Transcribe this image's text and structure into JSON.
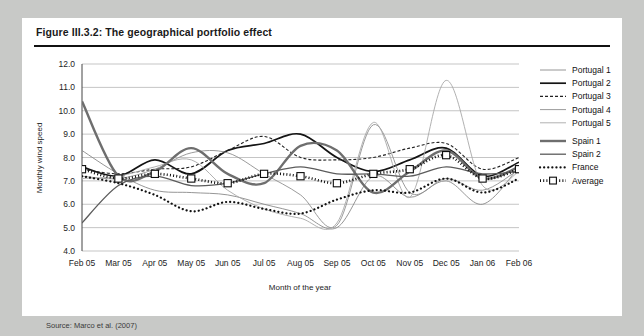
{
  "figure": {
    "title": "Figure III.3.2: The geographical portfolio effect",
    "source": "Source: Marco et al. (2007)"
  },
  "chart_data": {
    "type": "line",
    "title": "",
    "xlabel": "Month of the year",
    "ylabel": "Monthly wind speed",
    "ylim": [
      4.0,
      12.0
    ],
    "ytick_step": 1.0,
    "ytick_labels": [
      "12.0",
      "11.0",
      "10.0",
      "9.0",
      "8.0",
      "7.0",
      "6.0",
      "5.0",
      "4.0"
    ],
    "grid": "horizontal",
    "legend_position": "right",
    "categories": [
      "Feb 05",
      "Mar 05",
      "Apr 05",
      "May 05",
      "Jun 05",
      "Jul 05",
      "Aug 05",
      "Sep 05",
      "Oct 05",
      "Nov 05",
      "Dec 05",
      "Jan 06",
      "Feb 06"
    ],
    "series": [
      {
        "name": "Portugal 1",
        "style": "thin-solid-gray",
        "color": "#8a8a8a",
        "width": 0.9,
        "dash": "",
        "marker": "none",
        "values": [
          8.3,
          7.3,
          6.6,
          6.5,
          6.4,
          6.0,
          5.6,
          5.0,
          7.2,
          6.3,
          7.0,
          6.0,
          7.6
        ]
      },
      {
        "name": "Portugal 2",
        "style": "bold-solid-black",
        "color": "#141414",
        "width": 1.7,
        "dash": "",
        "marker": "none",
        "values": [
          7.6,
          7.2,
          7.9,
          7.3,
          8.3,
          8.6,
          9.0,
          8.0,
          7.4,
          7.9,
          8.4,
          7.2,
          7.8
        ]
      },
      {
        "name": "Portugal 3",
        "style": "dashed-black",
        "color": "#222222",
        "width": 1.1,
        "dash": "3,2",
        "marker": "none",
        "values": [
          7.5,
          7.3,
          7.5,
          7.6,
          8.3,
          8.9,
          8.0,
          7.9,
          8.0,
          8.4,
          8.6,
          7.5,
          8.0
        ]
      },
      {
        "name": "Portugal 4",
        "style": "thin-solid-gray",
        "color": "#909090",
        "width": 0.9,
        "dash": "",
        "marker": "none",
        "values": [
          7.2,
          7.1,
          7.5,
          8.2,
          8.2,
          7.3,
          6.4,
          5.1,
          9.4,
          6.5,
          7.1,
          6.6,
          7.5
        ]
      },
      {
        "name": "Portugal 5",
        "style": "thin-solid-light",
        "color": "#a8a8a8",
        "width": 0.9,
        "dash": "",
        "marker": "none",
        "values": [
          7.1,
          7.2,
          7.6,
          7.9,
          6.6,
          5.8,
          5.4,
          5.2,
          9.5,
          6.3,
          11.3,
          6.8,
          7.4
        ]
      },
      {
        "name": "Spain 1",
        "style": "thick-solid-gray",
        "color": "#6e6e6e",
        "width": 2.4,
        "dash": "",
        "marker": "none",
        "values": [
          10.4,
          7.2,
          7.4,
          8.4,
          7.3,
          6.9,
          8.5,
          8.3,
          6.5,
          7.4,
          8.3,
          7.1,
          7.6
        ]
      },
      {
        "name": "Spain 2",
        "style": "medium-solid-gray",
        "color": "#5c5c5c",
        "width": 1.3,
        "dash": "",
        "marker": "none",
        "values": [
          5.2,
          6.8,
          7.2,
          6.8,
          6.9,
          7.3,
          7.6,
          7.3,
          7.3,
          7.2,
          7.6,
          7.3,
          7.4
        ]
      },
      {
        "name": "France",
        "style": "dotted-bold-black",
        "color": "#111111",
        "width": 2.2,
        "dash": "0.1,4",
        "marker": "none",
        "values": [
          7.2,
          6.9,
          6.4,
          5.7,
          6.1,
          5.8,
          5.6,
          6.2,
          6.6,
          6.5,
          7.1,
          6.5,
          7.1
        ]
      },
      {
        "name": "Average",
        "style": "dotted-bold-black-square-markers",
        "color": "#0d0d0d",
        "width": 2.6,
        "dash": "1,2.2",
        "marker": "square",
        "values": [
          7.5,
          7.1,
          7.3,
          7.1,
          6.9,
          7.3,
          7.2,
          6.9,
          7.3,
          7.5,
          8.1,
          7.1,
          7.5
        ]
      }
    ]
  }
}
